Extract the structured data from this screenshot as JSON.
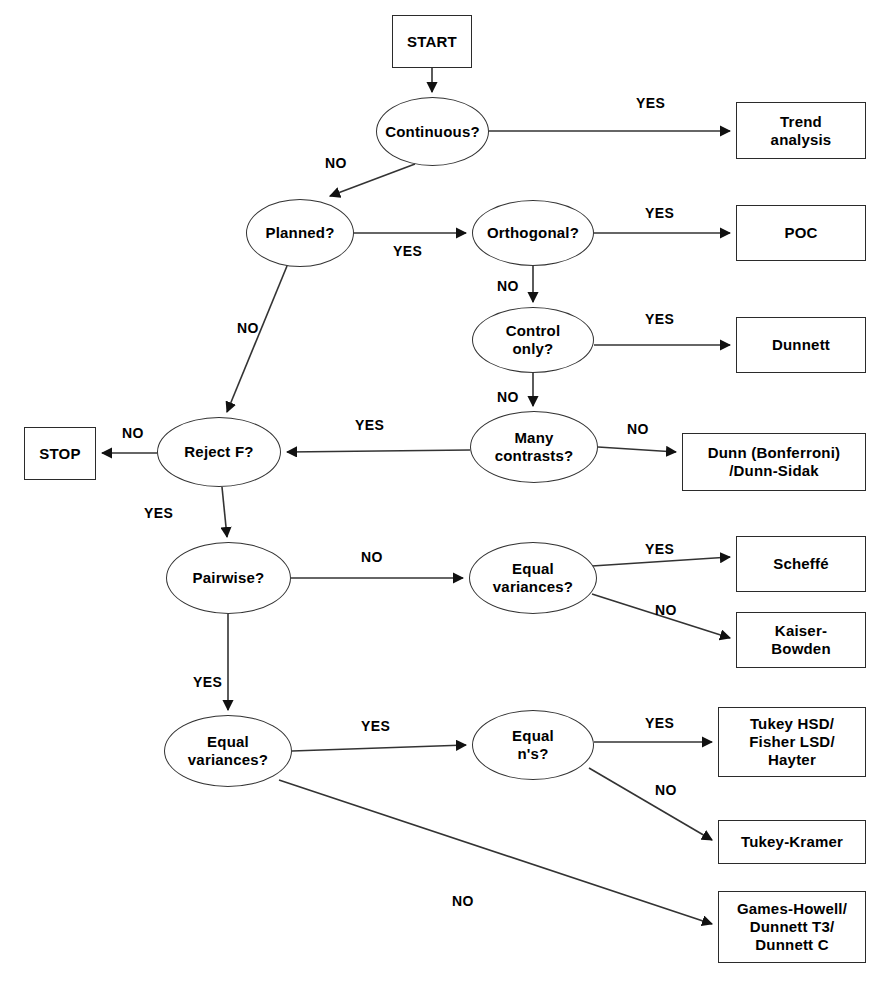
{
  "diagram": {
    "stroke_color": "#2b2b2b",
    "fill_color": "#ffffff",
    "text_color": "#000000"
  },
  "nodes": [
    {
      "id": "start",
      "label": "START",
      "shape": "box",
      "x": 392,
      "y": 15,
      "w": 80,
      "h": 53
    },
    {
      "id": "continuous",
      "label": "Continuous?",
      "shape": "ellipse",
      "x": 376,
      "y": 97,
      "w": 113,
      "h": 69
    },
    {
      "id": "trend",
      "label": "Trend\nanalysis",
      "shape": "box",
      "x": 736,
      "y": 102,
      "w": 130,
      "h": 57
    },
    {
      "id": "planned",
      "label": "Planned?",
      "shape": "ellipse",
      "x": 246,
      "y": 199,
      "w": 108,
      "h": 68
    },
    {
      "id": "orthogonal",
      "label": "Orthogonal?",
      "shape": "ellipse",
      "x": 472,
      "y": 200,
      "w": 122,
      "h": 66
    },
    {
      "id": "poc",
      "label": "POC",
      "shape": "box",
      "x": 736,
      "y": 205,
      "w": 130,
      "h": 56
    },
    {
      "id": "control_only",
      "label": "Control\nonly?",
      "shape": "ellipse",
      "x": 472,
      "y": 307,
      "w": 122,
      "h": 66
    },
    {
      "id": "dunnett",
      "label": "Dunnett",
      "shape": "box",
      "x": 736,
      "y": 317,
      "w": 130,
      "h": 56
    },
    {
      "id": "many_contrasts",
      "label": "Many\ncontrasts?",
      "shape": "ellipse",
      "x": 470,
      "y": 411,
      "w": 128,
      "h": 72
    },
    {
      "id": "dunn",
      "label": "Dunn (Bonferroni)\n/Dunn-Sidak",
      "shape": "box",
      "x": 682,
      "y": 433,
      "w": 184,
      "h": 58
    },
    {
      "id": "reject_f",
      "label": "Reject F?",
      "shape": "ellipse",
      "x": 157,
      "y": 417,
      "w": 124,
      "h": 70
    },
    {
      "id": "stop",
      "label": "STOP",
      "shape": "box",
      "x": 24,
      "y": 427,
      "w": 72,
      "h": 53
    },
    {
      "id": "pairwise",
      "label": "Pairwise?",
      "shape": "ellipse",
      "x": 166,
      "y": 542,
      "w": 125,
      "h": 72
    },
    {
      "id": "equal_var_1",
      "label": "Equal\nvariances?",
      "shape": "ellipse",
      "x": 469,
      "y": 542,
      "w": 128,
      "h": 72
    },
    {
      "id": "scheffe",
      "label": "Scheffé",
      "shape": "box",
      "x": 736,
      "y": 536,
      "w": 130,
      "h": 56
    },
    {
      "id": "kaiser_bowden",
      "label": "Kaiser-\nBowden",
      "shape": "box",
      "x": 736,
      "y": 612,
      "w": 130,
      "h": 56
    },
    {
      "id": "equal_var_2",
      "label": "Equal\nvariances?",
      "shape": "ellipse",
      "x": 164,
      "y": 715,
      "w": 128,
      "h": 72
    },
    {
      "id": "equal_ns",
      "label": "Equal\nn's?",
      "shape": "ellipse",
      "x": 472,
      "y": 710,
      "w": 122,
      "h": 70
    },
    {
      "id": "tukey_hsd",
      "label": "Tukey HSD/\nFisher LSD/\nHayter",
      "shape": "box",
      "x": 718,
      "y": 707,
      "w": 148,
      "h": 70
    },
    {
      "id": "tukey_kramer",
      "label": "Tukey-Kramer",
      "shape": "box",
      "x": 718,
      "y": 820,
      "w": 148,
      "h": 44
    },
    {
      "id": "games_howell",
      "label": "Games-Howell/\nDunnett T3/\nDunnett C",
      "shape": "box",
      "x": 718,
      "y": 891,
      "w": 148,
      "h": 72
    }
  ],
  "edges": [
    {
      "from": "start",
      "to": "continuous",
      "label": "",
      "label_x": 0,
      "label_y": 0
    },
    {
      "from": "continuous",
      "to": "trend",
      "label": "YES",
      "label_x": 636,
      "label_y": 95
    },
    {
      "from": "continuous",
      "to": "planned",
      "label": "NO",
      "label_x": 325,
      "label_y": 155
    },
    {
      "from": "planned",
      "to": "orthogonal",
      "label": "YES",
      "label_x": 393,
      "label_y": 243
    },
    {
      "from": "planned",
      "to": "reject_f",
      "label": "NO",
      "label_x": 237,
      "label_y": 320
    },
    {
      "from": "orthogonal",
      "to": "poc",
      "label": "YES",
      "label_x": 645,
      "label_y": 205
    },
    {
      "from": "orthogonal",
      "to": "control_only",
      "label": "NO",
      "label_x": 497,
      "label_y": 278
    },
    {
      "from": "control_only",
      "to": "dunnett",
      "label": "YES",
      "label_x": 645,
      "label_y": 311
    },
    {
      "from": "control_only",
      "to": "many_contrasts",
      "label": "NO",
      "label_x": 497,
      "label_y": 389
    },
    {
      "from": "many_contrasts",
      "to": "dunn",
      "label": "NO",
      "label_x": 627,
      "label_y": 421
    },
    {
      "from": "many_contrasts",
      "to": "reject_f",
      "label": "YES",
      "label_x": 355,
      "label_y": 417
    },
    {
      "from": "reject_f",
      "to": "stop",
      "label": "NO",
      "label_x": 122,
      "label_y": 425
    },
    {
      "from": "reject_f",
      "to": "pairwise",
      "label": "YES",
      "label_x": 144,
      "label_y": 505
    },
    {
      "from": "pairwise",
      "to": "equal_var_1",
      "label": "NO",
      "label_x": 361,
      "label_y": 549
    },
    {
      "from": "pairwise",
      "to": "equal_var_2",
      "label": "YES",
      "label_x": 193,
      "label_y": 674
    },
    {
      "from": "equal_var_1",
      "to": "scheffe",
      "label": "YES",
      "label_x": 645,
      "label_y": 541
    },
    {
      "from": "equal_var_1",
      "to": "kaiser_bowden",
      "label": "NO",
      "label_x": 655,
      "label_y": 602
    },
    {
      "from": "equal_var_2",
      "to": "equal_ns",
      "label": "YES",
      "label_x": 361,
      "label_y": 718
    },
    {
      "from": "equal_var_2",
      "to": "games_howell",
      "label": "NO",
      "label_x": 452,
      "label_y": 893
    },
    {
      "from": "equal_ns",
      "to": "tukey_hsd",
      "label": "YES",
      "label_x": 645,
      "label_y": 715
    },
    {
      "from": "equal_ns",
      "to": "tukey_kramer",
      "label": "NO",
      "label_x": 655,
      "label_y": 782
    }
  ],
  "wires": [
    {
      "name": "start-to-continuous",
      "d": "M 432 68 L 432 92"
    },
    {
      "name": "continuous-to-trend",
      "d": "M 489 131 L 730 131"
    },
    {
      "name": "continuous-to-planned",
      "d": "M 415 164 L 330 196"
    },
    {
      "name": "planned-to-orthogonal",
      "d": "M 354 233 L 466 233"
    },
    {
      "name": "planned-to-reject-f",
      "d": "M 287 266 L 227 412"
    },
    {
      "name": "orthogonal-to-poc",
      "d": "M 594 233 L 730 233"
    },
    {
      "name": "orthogonal-to-control",
      "d": "M 533 266 L 533 302"
    },
    {
      "name": "control-to-dunnett",
      "d": "M 594 345 L 730 345"
    },
    {
      "name": "control-to-many",
      "d": "M 533 373 L 533 406"
    },
    {
      "name": "many-to-dunn",
      "d": "M 598 447 L 676 452"
    },
    {
      "name": "many-to-reject-f",
      "d": "M 470 450 L 287 452"
    },
    {
      "name": "reject-f-to-stop",
      "d": "M 157 453 L 102 453"
    },
    {
      "name": "reject-f-to-pairwise",
      "d": "M 222 487 L 227 537"
    },
    {
      "name": "pairwise-to-equalvar1",
      "d": "M 291 578 L 463 578"
    },
    {
      "name": "pairwise-to-equalvar2",
      "d": "M 228 614 L 228 710"
    },
    {
      "name": "equalvar1-to-scheffe",
      "d": "M 592 566 L 730 557"
    },
    {
      "name": "equalvar1-to-kaiser",
      "d": "M 592 594 L 730 638"
    },
    {
      "name": "equalvar2-to-equalns",
      "d": "M 292 751 L 466 745"
    },
    {
      "name": "equalvar2-to-games",
      "d": "M 279 780 L 712 924"
    },
    {
      "name": "equalns-to-tukeyhsd",
      "d": "M 594 742 L 712 742"
    },
    {
      "name": "equalns-to-tukeykramer",
      "d": "M 589 768 L 712 840"
    }
  ]
}
